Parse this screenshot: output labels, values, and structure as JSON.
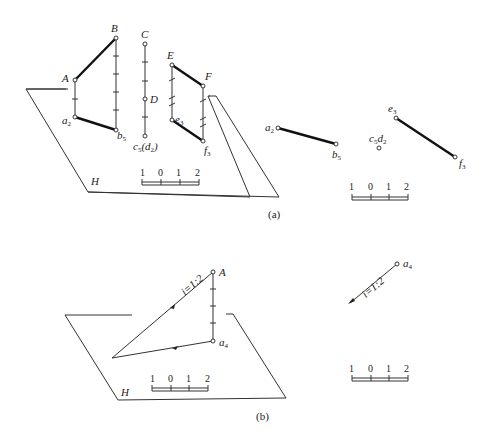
{
  "figure_a": {
    "caption": "(a)",
    "plane_label": "H",
    "perspective": {
      "points": {
        "A": "A",
        "B": "B",
        "C": "C",
        "D": "D",
        "E": "E",
        "F": "F",
        "a": "a",
        "a_sub": "2",
        "b": "b",
        "b_sub": "5",
        "c": "c",
        "c_sub": "5",
        "d_open": "(d",
        "d_sub": "2",
        "d_close": ")",
        "e": "e",
        "e_sub": "3",
        "f": "f",
        "f_sub": "3"
      },
      "scale": [
        "1",
        "0",
        "1",
        "2"
      ]
    },
    "projection": {
      "a": "a",
      "a_sub": "2",
      "b": "b",
      "b_sub": "5",
      "cd": "c",
      "cd_sub1": "5",
      "cd_d": "d",
      "cd_sub2": "2",
      "e": "e",
      "e_sub": "3",
      "f": "f",
      "f_sub": "3",
      "scale": [
        "1",
        "0",
        "1",
        "2"
      ]
    }
  },
  "figure_b": {
    "caption": "(b)",
    "plane_label": "H",
    "perspective": {
      "A": "A",
      "a": "a",
      "a_sub": "4",
      "slope": "i=1:2",
      "scale": [
        "1",
        "0",
        "1",
        "2"
      ]
    },
    "projection": {
      "a": "a",
      "a_sub": "4",
      "slope": "i=1:2",
      "scale": [
        "1",
        "0",
        "1",
        "2"
      ]
    }
  }
}
